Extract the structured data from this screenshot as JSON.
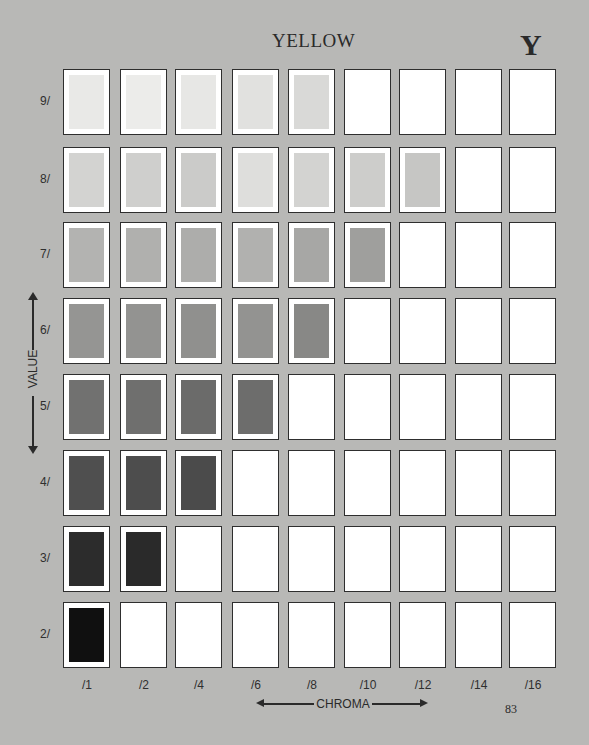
{
  "page": {
    "title": "YELLOW",
    "hue_letter": "Y",
    "page_number": "83",
    "background": "#b8b8b6"
  },
  "axes": {
    "value_label": "VALUE",
    "chroma_label": "CHROMA"
  },
  "columns": [
    {
      "label": "/1",
      "x": 63
    },
    {
      "label": "/2",
      "x": 120
    },
    {
      "label": "/4",
      "x": 175
    },
    {
      "label": "/6",
      "x": 232
    },
    {
      "label": "/8",
      "x": 288
    },
    {
      "label": "/10",
      "x": 344
    },
    {
      "label": "/12",
      "x": 399
    },
    {
      "label": "/14",
      "x": 455
    },
    {
      "label": "/16",
      "x": 509
    }
  ],
  "rows": [
    {
      "label": "9/",
      "y": 69,
      "fills": [
        "#e9e9e7",
        "#ececea",
        "#e7e7e5",
        "#e1e1df",
        "#d9d9d7",
        null,
        null,
        null,
        null
      ]
    },
    {
      "label": "8/",
      "y": 147,
      "fills": [
        "#d3d3d1",
        "#cfcfcd",
        "#cbcbc9",
        "#dededc",
        "#d3d3d1",
        "#cdcdcb",
        "#c6c6c4",
        null,
        null
      ]
    },
    {
      "label": "7/",
      "y": 222,
      "fills": [
        "#b3b3b1",
        "#b0b0ae",
        "#adadab",
        "#b1b1af",
        "#a7a7a5",
        "#9f9f9d",
        null,
        null,
        null
      ]
    },
    {
      "label": "6/",
      "y": 298,
      "fills": [
        "#959593",
        "#939391",
        "#90908e",
        "#939391",
        "#888886",
        null,
        null,
        null,
        null
      ]
    },
    {
      "label": "5/",
      "y": 374,
      "fills": [
        "#717170",
        "#6f6f6e",
        "#6b6b6a",
        "#6d6d6c",
        null,
        null,
        null,
        null,
        null
      ]
    },
    {
      "label": "4/",
      "y": 450,
      "fills": [
        "#4f4f4f",
        "#4d4d4d",
        "#4b4b4b",
        null,
        null,
        null,
        null,
        null,
        null
      ]
    },
    {
      "label": "3/",
      "y": 526,
      "fills": [
        "#2c2c2c",
        "#2a2a2a",
        null,
        null,
        null,
        null,
        null,
        null,
        null
      ]
    },
    {
      "label": "2/",
      "y": 602,
      "fills": [
        "#101010",
        null,
        null,
        null,
        null,
        null,
        null,
        null,
        null
      ]
    }
  ]
}
